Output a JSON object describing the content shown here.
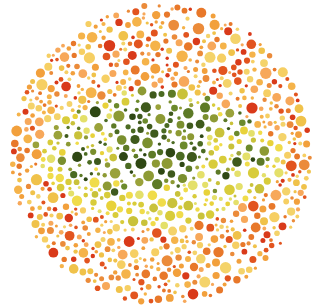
{
  "plate": {
    "center_x": 161,
    "center_y": 154,
    "radius": 152,
    "background": "#ffffff"
  },
  "figure": {
    "palette_background": [
      "#f2a03c",
      "#f5b34a",
      "#e8782a",
      "#f0c24a",
      "#e2541f",
      "#f6cf63",
      "#eb8b3a",
      "#f4d36a",
      "#d93a1a",
      "#f7a85a"
    ],
    "palette_figure": [
      "#5d7a26",
      "#7a8f2e",
      "#3f5a1c",
      "#8d9a34",
      "#4b6b22",
      "#2f4814",
      "#9aa23a",
      "#6c8a2c"
    ],
    "palette_highlight": [
      "#e8d23a",
      "#d8cc3a",
      "#f0dc4a",
      "#c9c23a",
      "#e4e06a"
    ]
  },
  "caption": "Ishihara-style dot plate depicting an eye"
}
